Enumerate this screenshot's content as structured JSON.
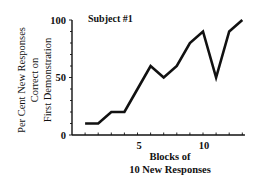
{
  "chart_data": {
    "type": "line",
    "title": "Subject #1",
    "xlabel": "Blocks of 10 New Responses",
    "xlabel_lines": [
      "Blocks of",
      "10 New Responses"
    ],
    "ylabel": "Per Cent New Responses Correct on First Demonstration",
    "ylabel_lines": [
      "Per Cent New Responses",
      "Correct on",
      "First Demonstration"
    ],
    "x": [
      1,
      2,
      3,
      4,
      5,
      6,
      7,
      8,
      9,
      10,
      11,
      12,
      13
    ],
    "series": [
      {
        "name": "Subject #1",
        "values": [
          10,
          10,
          20,
          20,
          40,
          60,
          50,
          60,
          80,
          90,
          50,
          90,
          100
        ]
      }
    ],
    "xlim": [
      0,
      13
    ],
    "ylim": [
      0,
      100
    ],
    "xticks_labeled": [
      5,
      10
    ],
    "yticks_labeled": [
      0,
      50,
      100
    ],
    "grid": false,
    "legend": "none"
  },
  "labels": {
    "subject": "Subject #1",
    "ytick_0": "0",
    "ytick_50": "50",
    "ytick_100": "100",
    "xtick_5": "5",
    "xtick_10": "10"
  }
}
